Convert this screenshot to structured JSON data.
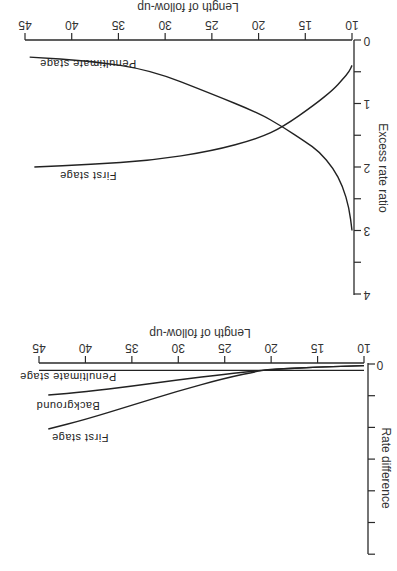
{
  "chart_data": [
    {
      "type": "line",
      "orientation": "rotated-180",
      "xlabel": "Length of follow-up",
      "ylabel": "Excess rate ratio",
      "xlim": [
        10,
        45
      ],
      "ylim": [
        0,
        4
      ],
      "xticks": [
        "10",
        "15",
        "20",
        "25",
        "30",
        "35",
        "40",
        "45"
      ],
      "yticks": [
        "0",
        "1",
        "2",
        "3",
        "4"
      ],
      "yminor_ticks": [
        0.5,
        1.5,
        2.5,
        3.5
      ],
      "series": [
        {
          "name": "First stage",
          "label": "First stage",
          "x": [
            10,
            10.3,
            11,
            12,
            14,
            17.4,
            20,
            25,
            31.6,
            38,
            44
          ],
          "y": [
            0.4,
            0.5,
            0.62,
            0.78,
            1.02,
            1.37,
            1.55,
            1.75,
            1.9,
            1.96,
            2.0
          ]
        },
        {
          "name": "Penultimate stage",
          "label": "Penultimate stage",
          "x": [
            10,
            10.3,
            11,
            12,
            13.5,
            15,
            17.4,
            20,
            25,
            31.6,
            38,
            44.5
          ],
          "y": [
            3.0,
            2.65,
            2.3,
            2.02,
            1.76,
            1.6,
            1.37,
            1.15,
            0.85,
            0.47,
            0.33,
            0.27
          ]
        }
      ]
    },
    {
      "type": "line",
      "orientation": "rotated-180",
      "xlabel": "Length of follow-up",
      "ylabel": "Rate difference",
      "xlim": [
        10,
        45
      ],
      "ylim_tick_units": [
        0,
        6
      ],
      "xticks": [
        "10",
        "15",
        "20",
        "25",
        "30",
        "35",
        "40",
        "45"
      ],
      "yticks": [
        "0",
        "",
        "",
        "",
        "",
        "",
        ""
      ],
      "series": [
        {
          "name": "Penultimate stage",
          "label": "Penultimate stage",
          "x": [
            10,
            45
          ],
          "y": [
            0.2,
            0.2
          ]
        },
        {
          "name": "Background",
          "label": "Background",
          "x": [
            10,
            15,
            20,
            21,
            25,
            30,
            35,
            40,
            44
          ],
          "y": [
            0.05,
            0.1,
            0.17,
            0.2,
            0.32,
            0.5,
            0.7,
            0.88,
            0.98
          ]
        },
        {
          "name": "First stage",
          "label": "First stage",
          "x": [
            10,
            15,
            20,
            21,
            25,
            30,
            35,
            40,
            44
          ],
          "y": [
            0.05,
            0.1,
            0.17,
            0.2,
            0.45,
            0.85,
            1.3,
            1.75,
            2.05
          ]
        }
      ]
    }
  ]
}
